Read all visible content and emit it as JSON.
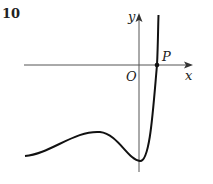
{
  "question_number": "10",
  "labels": {
    "y_axis": "y",
    "x_axis": "x",
    "origin": "O",
    "point": "P"
  },
  "colors": {
    "curve": "#111111",
    "axes": "#555555"
  }
}
